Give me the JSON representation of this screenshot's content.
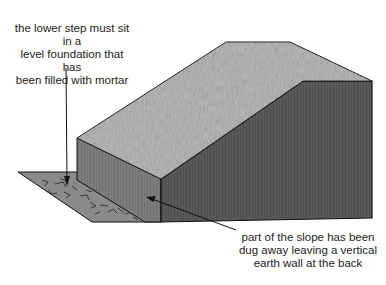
{
  "diagram": {
    "labels": [
      {
        "id": "foundation",
        "text": "the lower step must sit in a\nlevel foundation that has\nbeen filled with mortar"
      },
      {
        "id": "earth-wall",
        "text": "part of the slope has been\ndug away leaving a vertical\nearth wall at the back"
      }
    ],
    "colors": {
      "grass": "#a8a8a8",
      "front_face": "#7a7a7a",
      "side_face": "#555555",
      "foundation": "#8c8c8c",
      "outline": "#111111"
    }
  }
}
